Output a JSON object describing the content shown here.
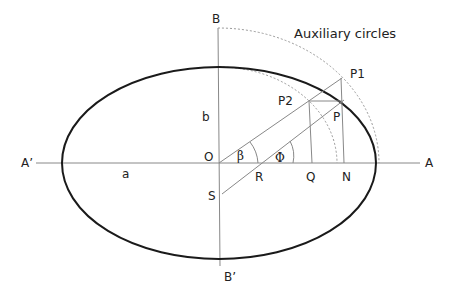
{
  "diagram": {
    "title": "Auxiliary circles",
    "labels": {
      "B": "B",
      "B_prime": "B’",
      "A": "A",
      "A_prime": "A’",
      "O": "O",
      "a": "a",
      "b": "b",
      "S": "S",
      "R": "R",
      "Q": "Q",
      "N": "N",
      "P": "P",
      "P1": "P1",
      "P2": "P2",
      "beta": "β",
      "phi": "Φ"
    },
    "colors": {
      "ellipse": "#1a1a1a",
      "lines": "#888888",
      "dotted": "#999999",
      "text": "#222222"
    }
  }
}
